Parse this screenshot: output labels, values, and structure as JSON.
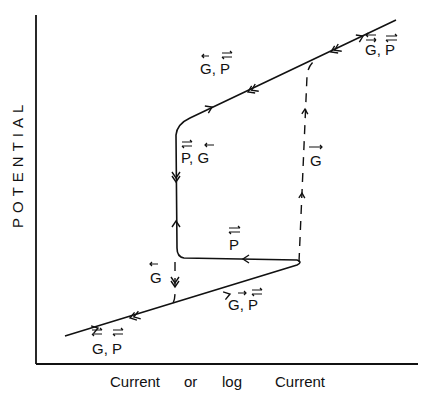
{
  "figure": {
    "y_axis_label": "POTENTIAL",
    "x_axis_label_parts": [
      "Current",
      "or",
      "log",
      "Current"
    ]
  },
  "labels": {
    "upper_right": {
      "text": "G, P",
      "g_arrow": "double",
      "p_arrow": "double"
    },
    "upper_mid": {
      "text": "G, P",
      "g_arrow": "left",
      "p_arrow": "double"
    },
    "left_knee": {
      "text": "P, G",
      "p_arrow": "double",
      "g_arrow": "left"
    },
    "dashed_right": {
      "text": "G",
      "g_arrow": "right"
    },
    "horizontal": {
      "text": "P",
      "p_arrow": "double"
    },
    "dashed_left": {
      "text": "G",
      "g_arrow": "left"
    },
    "lower_mid": {
      "text": "G, P",
      "g_arrow": "right",
      "p_arrow": "double"
    },
    "lower_left": {
      "text": "G, P",
      "g_arrow": "double",
      "p_arrow": "double"
    }
  },
  "legend_semantics": {
    "G": "G",
    "P": "P"
  }
}
